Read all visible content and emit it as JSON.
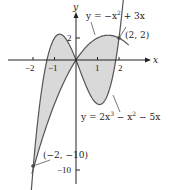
{
  "chart_data": {
    "type": "area",
    "title": "",
    "xlabel": "x",
    "ylabel": "y",
    "xlim": [
      -2.3,
      2.6
    ],
    "ylim": [
      -11,
      4
    ],
    "x_ticks": [
      "-2",
      "-1",
      "1",
      "2"
    ],
    "y_ticks": [
      "2",
      "-10"
    ],
    "grid": false,
    "series": [
      {
        "name": "y = -x^2 + 3x",
        "label": "y = −x² + 3x",
        "function": "-x^2+3x",
        "x_range": [
          0,
          2.4
        ]
      },
      {
        "name": "y = 2x^3 - x^2 - 5x",
        "label": "y = 2x³ − x² − 5x",
        "function": "2x^3-x^2-5x",
        "x_range": [
          -2.05,
          2.25
        ]
      }
    ],
    "shaded_regions": [
      {
        "between": [
          "2x^3-x^2-5x",
          "-x^2+3x"
        ],
        "x_range": [
          -2,
          0
        ]
      },
      {
        "between": [
          "-x^2+3x",
          "2x^3-x^2-5x"
        ],
        "x_range": [
          0,
          2
        ]
      }
    ],
    "annotations": [
      {
        "text": "(2, 2)",
        "point": [
          2,
          2
        ]
      },
      {
        "text": "(−2, −10)",
        "point": [
          -2,
          -10
        ]
      }
    ],
    "colors": {
      "fill": "#d9d9d9",
      "curve": "#555555",
      "axis": "#222222"
    }
  },
  "labels": {
    "x_axis": "x",
    "y_axis": "y",
    "tick_m2": "−2",
    "tick_m1": "−1",
    "tick_1": "1",
    "tick_2": "2",
    "tick_y2": "2",
    "tick_ym10": "−10",
    "curve1": "y = −x",
    "curve1_exp": "2",
    "curve1_rest": " + 3x",
    "curve2": "y = 2x",
    "curve2_exp1": "3",
    "curve2_mid": " − x",
    "curve2_exp2": "2",
    "curve2_rest": " − 5x",
    "pt1": "(2, 2)",
    "pt2": "(−2, −10)"
  }
}
